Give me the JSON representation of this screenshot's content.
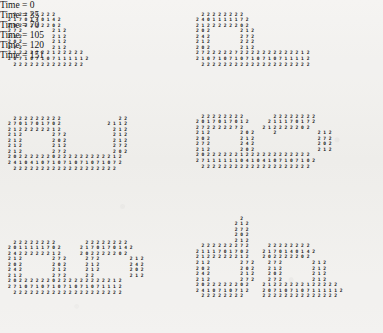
{
  "figure": {
    "background_color": "#f2f1ef",
    "ink_color": "#161616",
    "columns": 2,
    "rows": 3
  },
  "chart_data": {
    "type": "heatmap",
    "xlabel": "",
    "ylabel": "",
    "legend": [],
    "symbols": [
      "2",
      "0",
      "1",
      "4",
      "7"
    ],
    "panels": [
      {
        "time": 0,
        "caption": "Time = 0",
        "rows": [
          "  2 2 2 2 2 2 2 2",
          "2 1 7 0 1 4 0 1 4 2",
          "2 0 2 2 2 2 2 2 0 2",
          "2 7 2           2 1 2",
          "2 1 2           2 1 2",
          "2 0 2           2 1 2",
          "2 7 2           2 1 2",
          "2 1 2 2 2 2 2 2 1 2 2 2 2 2",
          "2 0 7 1 0 7 1 0 7 1 1 1 1 1 2",
          "  2 2 2 2 2 2 2 2 2 2 2 2 2"
        ]
      },
      {
        "time": 35,
        "caption": "Time = 35",
        "rows": [
          "  2 2 2 2 2 2 2 2",
          "2 4 0 1 1 1 1 1 7 2",
          "2 1 2 2 2 2 2 2 0 2",
          "2 0 2           2 1 2",
          "2 4 2           2 7 2",
          "2 1 2           2 2 2",
          "2 0 2           2 1 2",
          "2 7 2 2 2 2 2 7 2 2 2 2 2 2 2 2 2 2 2 1 2",
          "2 1 0 7 1 0 7 1 0 7 1 0 7 1 0 7 1 1 1 1 2",
          "  2 2 2 2 2 2 2 2 2 2 2 2 2 2 2 2 2 2 2 2"
        ]
      },
      {
        "time": 70,
        "caption": "Time = 70",
        "rows": [
          "  2 2 2 2 2 2 2 2 2                     2 2",
          "2 7 0 1 7 0 1 7 0 2                 2 1 1 2",
          "2 1 2 2 2 2 2 2 1 2                   2 1 2",
          "2 1 2           2 7 2                 2 1 2",
          "2 1 2           2 0 2                 2 1 2",
          "2 1 2           2 1 2                 2 7 2",
          "2 1 2           2 7 2                 2 0 2",
          "2 0 2 2 2 2 2 2 0 2 2 2 2 2 2 2 2 2 2 1 2",
          "2 4 1 0 4 1 0 7 1 0 7 1 0 7 1 0 7 1 0 7 2",
          "  2 2 2 2 2 2 2 2 2 2 2 2 2 2 2 2 2 2 2"
        ]
      },
      {
        "time": 105,
        "caption": "Time = 105",
        "rows": [
          "  2 2 2 2 2 2 2 2           2 2 2 2 2 2 2 2",
          "2 0 1 7 0 1 7 0 1 2       2 1 1 1 7 0 1 7 2",
          "2 7 2 2 2 2 2 7 2       2 1 2 2 2 2 2 0 2",
          "2 1 2           2 0 2       2               2 1 2",
          "2 0 2           2 1 2                       2 7 2",
          "2 7 2           2 4 2                       2 0 2",
          "2 1 2           2 0 2                       2 1 2",
          "2 0 2 2 2 2 2 2 1 2 2 2 2 2 2 2 2 2 2 2 2",
          "2 7 1 1 1 1 1 1 0 4 1 0 4 1 0 7 1 0 7 1 0 2",
          "  2 2 2 2 2 2 2 2 2 2 2 2 2 2 2 2 2 2 2 2"
        ]
      },
      {
        "time": 120,
        "caption": "Time = 120",
        "rows": [
          "  2 2 2 2 2 2 2 2           2 2 2 2 2 2 2 2",
          "2 0 1 1 1 1 1 7 0 2       2 1 7 0 1 7 0 1 4 2",
          "2 4 2 2 2 2 2 2 1 2       2 0 2 2 2 2 2 0 2",
          "2 1 2           2 7 2       2 7 2           2 1 2",
          "2 0 2           2 0 2       2 1 2           2 4 2",
          "2 4 2           2 1 2       2 1 2           2 0 2",
          "2 1 2           2 7 2       2 2             2 1 2",
          "2 0 2 2 2 2 2 2 0 2 2 2 2 2 2 2 2 2 2 1 2",
          "2 7 1 0 7 1 0 7 1 0 7 1 0 7 1 0 7 1 1 1 2",
          "  2 2 2 2 2 2 2 2 2 2 2 2 2 2 2 2 2 2 2 2"
        ]
      },
      {
        "time": 151,
        "caption": "Time = 151",
        "rows": [
          "                2",
          "              2 1 2",
          "              2 7 2",
          "              2 0 2",
          "              2 1 2",
          "  2 2 2 2 2 2 2 7 2       2 2 2 2 2 2 2 2",
          "2 1 1 1 7 0 1 7 0 2     2 1 7 0 1 4 0 1 4 2",
          "2 1 2 2 2 2 2 2 1 2     2 0 2 2 2 2 2 0 2",
          "2 1 2           2 7 2     2 7 2           2 1 2",
          "2 0 2           2 0 2     2 1 2           2 1 2",
          "2 4 2           2 1 2     2 0 2           2 1 2",
          "2 1 2           2 7 2     2 7 2           2 1 2",
          "2 0 2 2 2 2 2 2 0 2     2 1 2 2 2 2 2 2 1 2 2 2 2 2",
          "2 4 1 0 7 1 0 7 1 2     2 0 7 1 0 7 1 0 7 1 1 1 1 1 2",
          "  2 2 2 2 2 2 2 2       2 2 2 2 2 2 2 2 2 2 2 2 2 2"
        ]
      }
    ]
  }
}
